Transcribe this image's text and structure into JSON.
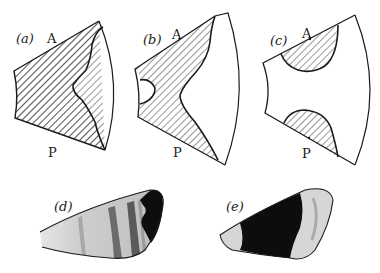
{
  "figure": {
    "panels": [
      {
        "id": "a",
        "label": "(a)",
        "anterior": "A",
        "posterior": "P",
        "pattern": "hatched region covering most of wing with unhatched notch at distal edge"
      },
      {
        "id": "b",
        "label": "(b)",
        "anterior": "A",
        "posterior": "P",
        "pattern": "hatched region with unhatched notches at proximal and distal edges"
      },
      {
        "id": "c",
        "label": "(c)",
        "anterior": "A",
        "posterior": "P",
        "pattern": "two hatched lobes at anterior and posterior edges"
      },
      {
        "id": "d",
        "label": "(d)",
        "pattern": "banded wing with dark distal patch"
      },
      {
        "id": "e",
        "label": "(e)",
        "pattern": "wing with dark central band and pale ends"
      }
    ],
    "colors": {
      "ink": "#1a1a1a",
      "paper": "#ffffff",
      "dark_fill": "#0d0d0d",
      "grey_band": "#8a8a8a",
      "light_band": "#d9d9d9"
    }
  }
}
